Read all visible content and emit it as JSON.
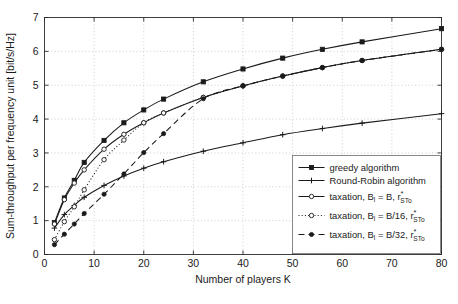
{
  "chart_data": {
    "type": "line",
    "title": "",
    "xlabel": "Number of players K",
    "ylabel": "Sum-throughput per frequency unit [bit/s/Hz]",
    "xlim": [
      0,
      80
    ],
    "ylim": [
      0,
      7
    ],
    "xticks": [
      0,
      10,
      20,
      30,
      40,
      50,
      60,
      70,
      80
    ],
    "yticks": [
      0,
      1,
      2,
      3,
      4,
      5,
      6,
      7
    ],
    "grid": true,
    "legend_position": "lower right",
    "x": [
      2,
      4,
      6,
      8,
      12,
      16,
      20,
      24,
      32,
      40,
      48,
      56,
      64,
      80
    ],
    "series": [
      {
        "name": "greedy algorithm",
        "marker": "filled-square",
        "linestyle": "solid",
        "values": [
          0.94,
          1.67,
          2.19,
          2.72,
          3.37,
          3.89,
          4.27,
          4.59,
          5.1,
          5.48,
          5.8,
          6.06,
          6.28,
          6.67
        ]
      },
      {
        "name": "Round-Robin algorithm",
        "marker": "plus",
        "linestyle": "solid",
        "values": [
          0.78,
          1.18,
          1.45,
          1.69,
          2.04,
          2.32,
          2.55,
          2.74,
          3.05,
          3.3,
          3.54,
          3.72,
          3.88,
          4.16
        ]
      },
      {
        "name": "taxation, B_l = B, r*_STo",
        "marker": "open-circle",
        "linestyle": "solid",
        "values": [
          0.9,
          1.62,
          2.11,
          2.5,
          3.11,
          3.55,
          3.89,
          4.18,
          4.64,
          4.98,
          5.27,
          5.52,
          5.73,
          6.06
        ]
      },
      {
        "name": "taxation, B_l = B/16, r*_STo",
        "marker": "open-circle",
        "linestyle": "dotted",
        "values": [
          0.44,
          0.97,
          1.41,
          1.91,
          2.8,
          3.38,
          3.89,
          4.18,
          4.64,
          4.98,
          5.27,
          5.52,
          5.73,
          6.06
        ]
      },
      {
        "name": "taxation, B_l = B/32, r*_STo",
        "marker": "filled-circle",
        "linestyle": "dashed",
        "values": [
          0.29,
          0.6,
          0.9,
          1.21,
          1.78,
          2.38,
          3.01,
          3.57,
          4.6,
          4.98,
          5.27,
          5.52,
          5.73,
          6.06
        ]
      }
    ]
  },
  "axes": {
    "ylabel": "Sum-throughput per frequency unit [bit/s/Hz]",
    "xlabel": "Number of players K",
    "xtick_labels": [
      "0",
      "10",
      "20",
      "30",
      "40",
      "50",
      "60",
      "70",
      "80"
    ],
    "ytick_labels": [
      "0",
      "1",
      "2",
      "3",
      "4",
      "5",
      "6",
      "7"
    ]
  },
  "legend": {
    "entries": [
      {
        "label": "greedy algorithm",
        "prefix": "",
        "var": "",
        "eq": "",
        "sup": "",
        "sub": "",
        "marker": "filled-square",
        "style": "solid"
      },
      {
        "label": "Round-Robin algorithm",
        "prefix": "",
        "var": "",
        "eq": "",
        "sup": "",
        "sub": "",
        "marker": "plus",
        "style": "solid"
      },
      {
        "label": "taxation, B",
        "prefix": "taxation, B",
        "var": "l",
        "eq": " = B, r",
        "sup": "*",
        "sub": "STo",
        "marker": "open-circle",
        "style": "solid"
      },
      {
        "label": "taxation, B",
        "prefix": "taxation, B",
        "var": "l",
        "eq": " = B/16, r",
        "sup": "*",
        "sub": "STo",
        "marker": "open-circle",
        "style": "dotted"
      },
      {
        "label": "taxation, B",
        "prefix": "taxation, B",
        "var": "l",
        "eq": " = B/32, r",
        "sup": "*",
        "sub": "STo",
        "marker": "filled-circle",
        "style": "dashed"
      }
    ]
  },
  "colors": {
    "line": "#1a1a1a",
    "grid": "#b9b9b9",
    "axis": "#2b2b2b",
    "legend_border": "#6e6e6e",
    "background": "#ffffff"
  }
}
